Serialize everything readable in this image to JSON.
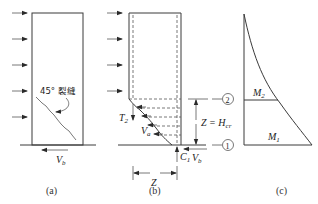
{
  "panels": {
    "a": {
      "caption": "(a)",
      "crack_label": "45° 裂缝",
      "shear_label": "V",
      "shear_sub": "b"
    },
    "b": {
      "caption": "(b)",
      "t2_label": "T",
      "t2_sub": "2",
      "va_label": "V",
      "va_sub": "a",
      "c1_label": "C",
      "c1_sub": "1",
      "vb_label": "V",
      "vb_sub": "b",
      "z_label": "Z",
      "zh_label": "Z = H",
      "zh_sub": "cr",
      "section2": "2",
      "section1": "1"
    },
    "c": {
      "caption": "(c)",
      "m2_label": "M",
      "m2_sub": "2",
      "m1_label": "M",
      "m1_sub": "1"
    }
  }
}
